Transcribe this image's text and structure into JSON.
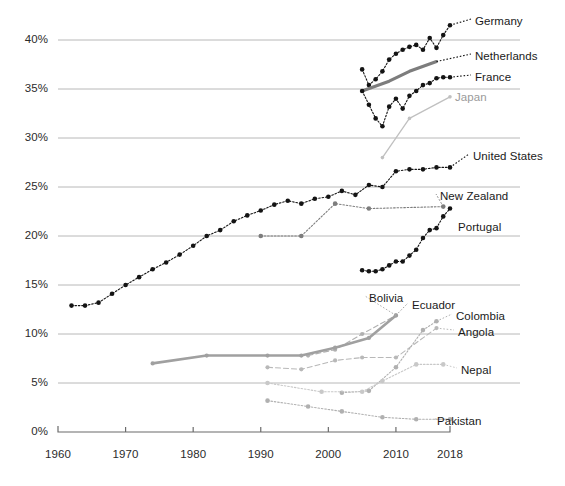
{
  "chart": {
    "type": "line",
    "title": "",
    "subtitle": "",
    "xlabel": "",
    "ylabel": "",
    "legend_position": "right-inline",
    "grid": "horizontal",
    "background_color": "#ffffff",
    "axis_color": "#6b6b6b",
    "gridline_color": "#b8b8b8",
    "dark_series_color": "#141414",
    "mid_series_color": "#7d7d7d",
    "light_series_color": "#c0c0c0"
  },
  "axes": {
    "y": {
      "min": 0,
      "max": 42.5,
      "tick_values": [
        0,
        5,
        10,
        15,
        20,
        25,
        30,
        35,
        40
      ],
      "tick_labels": [
        "0%",
        "5%",
        "10%",
        "15%",
        "20%",
        "25%",
        "30%",
        "35%",
        "40%"
      ]
    },
    "x": {
      "min": 1960,
      "max": 2018,
      "tick_values": [
        1960,
        1970,
        1980,
        1990,
        2000,
        2010,
        2018
      ],
      "tick_labels": [
        "1960",
        "1970",
        "1980",
        "1990",
        "2000",
        "2010",
        "2018"
      ]
    }
  },
  "labels": {
    "germany": "Germany",
    "netherlands": "Netherlands",
    "france": "France",
    "japan": "Japan",
    "united_states": "United States",
    "new_zealand": "New Zealand",
    "portugal": "Portugal",
    "bolivia": "Bolivia",
    "ecuador": "Ecuador",
    "colombia": "Colombia",
    "angola": "Angola",
    "nepal": "Nepal",
    "pakistan": "Pakistan"
  },
  "chart_data": {
    "type": "line",
    "title": "",
    "xlabel": "",
    "ylabel": "",
    "xlim": [
      1960,
      2018
    ],
    "ylim": [
      0,
      42.5
    ],
    "grid": "horizontal only",
    "legend_position": "inline right of each series",
    "series": [
      {
        "name": "Germany",
        "style": "dotted-with-markers",
        "color": "#141414",
        "x": [
          2005,
          2006,
          2007,
          2008,
          2009,
          2010,
          2011,
          2012,
          2013,
          2014,
          2015,
          2016,
          2017,
          2018
        ],
        "values": [
          37.0,
          35.4,
          36.0,
          36.8,
          38.0,
          38.6,
          39.0,
          39.3,
          39.5,
          39.0,
          40.2,
          39.2,
          40.5,
          41.5
        ]
      },
      {
        "name": "Netherlands",
        "style": "thick-solid",
        "color": "#7d7d7d",
        "x": [
          2005,
          2009,
          2012,
          2016
        ],
        "values": [
          34.8,
          35.8,
          36.8,
          37.8
        ]
      },
      {
        "name": "France",
        "style": "dotted-with-markers",
        "color": "#141414",
        "x": [
          2005,
          2006,
          2007,
          2008,
          2009,
          2010,
          2011,
          2012,
          2013,
          2014,
          2015,
          2016,
          2017,
          2018
        ],
        "values": [
          34.8,
          33.4,
          32.0,
          31.2,
          33.2,
          34.0,
          33.0,
          34.3,
          34.8,
          35.4,
          35.6,
          36.1,
          36.2,
          36.2
        ]
      },
      {
        "name": "Japan",
        "style": "thin-solid",
        "color": "#c0c0c0",
        "x": [
          2008,
          2012,
          2018
        ],
        "values": [
          28.0,
          32.0,
          34.2
        ]
      },
      {
        "name": "United States",
        "style": "dotted-with-markers",
        "color": "#141414",
        "x": [
          1962,
          1964,
          1966,
          1968,
          1970,
          1972,
          1974,
          1976,
          1978,
          1980,
          1982,
          1984,
          1986,
          1988,
          1990,
          1992,
          1994,
          1996,
          1998,
          2000,
          2002,
          2004,
          2006,
          2008,
          2010,
          2012,
          2014,
          2016,
          2018
        ],
        "values": [
          12.9,
          12.9,
          13.2,
          14.1,
          15.0,
          15.8,
          16.6,
          17.3,
          18.1,
          19.0,
          20.0,
          20.6,
          21.5,
          22.1,
          22.6,
          23.2,
          23.6,
          23.3,
          23.8,
          24.0,
          24.6,
          24.2,
          25.2,
          25.0,
          26.6,
          26.8,
          26.8,
          27.0,
          27.0
        ]
      },
      {
        "name": "New Zealand",
        "style": "dotted-with-markers",
        "color": "#7d7d7d",
        "x": [
          1990,
          1996,
          2001,
          2006,
          2017
        ],
        "values": [
          20.0,
          20.0,
          23.3,
          22.8,
          23.0
        ]
      },
      {
        "name": "Portugal",
        "style": "dotted-with-markers",
        "color": "#141414",
        "x": [
          2005,
          2006,
          2007,
          2008,
          2009,
          2010,
          2011,
          2012,
          2013,
          2014,
          2015,
          2016,
          2017,
          2018
        ],
        "values": [
          16.5,
          16.4,
          16.4,
          16.6,
          17.0,
          17.4,
          17.4,
          18.0,
          18.6,
          19.8,
          20.6,
          20.8,
          22.0,
          22.8
        ]
      },
      {
        "name": "Bolivia",
        "style": "dashed-with-markers",
        "color": "#b0b0b0",
        "x": [
          1997,
          2001,
          2005,
          2010
        ],
        "values": [
          7.8,
          8.4,
          10.0,
          11.9
        ]
      },
      {
        "name": "Ecuador",
        "style": "thick-solid-with-markers",
        "color": "#a0a0a0",
        "x": [
          1974,
          1982,
          1991,
          1996,
          2001,
          2006,
          2010
        ],
        "values": [
          7.0,
          7.8,
          7.8,
          7.8,
          8.6,
          9.6,
          11.9
        ]
      },
      {
        "name": "Colombia",
        "style": "dotted-with-markers",
        "color": "#b0b0b0",
        "x": [
          2002,
          2006,
          2010,
          2014,
          2016
        ],
        "values": [
          4.0,
          4.2,
          6.6,
          10.4,
          11.3
        ]
      },
      {
        "name": "Angola",
        "style": "dashed-with-markers",
        "color": "#b8b8b8",
        "x": [
          1991,
          1996,
          2001,
          2005,
          2010,
          2016
        ],
        "values": [
          6.6,
          6.4,
          7.3,
          7.6,
          7.6,
          10.6
        ]
      },
      {
        "name": "Nepal",
        "style": "dotted-with-markers",
        "color": "#c8c8c8",
        "x": [
          1991,
          1999,
          2005,
          2008,
          2013,
          2017
        ],
        "values": [
          5.0,
          4.1,
          4.1,
          5.2,
          6.9,
          6.9
        ]
      },
      {
        "name": "Pakistan",
        "style": "dotted-with-markers",
        "color": "#b0b0b0",
        "x": [
          1991,
          1997,
          2002,
          2008,
          2013,
          2018
        ],
        "values": [
          3.2,
          2.6,
          2.1,
          1.5,
          1.3,
          1.3
        ]
      }
    ]
  }
}
